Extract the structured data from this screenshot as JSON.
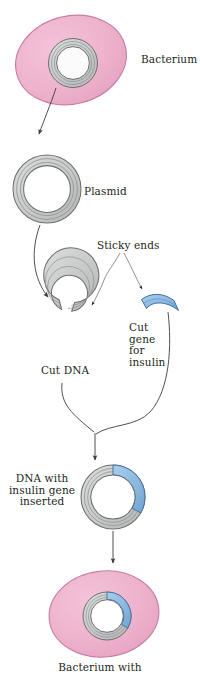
{
  "figure": {
    "background_color": "#ffffff"
  },
  "labels": {
    "bacterium": "Bacterium",
    "plasmid": "Plasmid",
    "sticky_ends": "Sticky ends",
    "cut_dna": "Cut DNA",
    "cut_gene_for_insulin": "Cut\ngene\nfor\ninsulin",
    "dna_with_insulin_gene_inserted": "DNA with\ninsulin gene\ninserted",
    "bacterium_with": "Bacterium with"
  },
  "colors": {
    "bacterium_fill": "#eeb3cd",
    "bacterium_stroke": "#c77ba4",
    "dna_fill": "#c9cbcb",
    "dna_stroke": "#6d6e70",
    "dna_inner_line": "#8c8e90",
    "gene_fill": "#8cb9e0",
    "gene_stroke": "#3f6fa5",
    "cytoplasm_gap": "#ffffff",
    "arrow": "#3b3b3b",
    "text": "#231f20"
  },
  "stages": [
    {
      "id": "stage-1-bacterium",
      "name": "Bacterium",
      "label": "Bacterium",
      "description": "Pink oval bacterium cell containing a circular plasmid"
    },
    {
      "id": "stage-2-plasmid",
      "name": "Plasmid",
      "label": "Plasmid",
      "description": "Closed circular double-stranded DNA ring isolated from the bacterium"
    },
    {
      "id": "stage-3-cut-dna",
      "name": "Cut DNA",
      "label": "Cut DNA",
      "description": "Plasmid opened by restriction enzyme, leaving sticky ends"
    },
    {
      "id": "stage-4-cut-gene",
      "name": "Cut gene for insulin",
      "label": "Cut\ngene\nfor\ninsulin",
      "description": "Blue arc representing the excised human insulin gene with sticky ends"
    },
    {
      "id": "stage-5-recombinant",
      "name": "DNA with insulin gene inserted",
      "label": "DNA with\ninsulin gene\ninserted",
      "description": "Recombinant plasmid, gray ring with blue insulin gene segment spliced in"
    },
    {
      "id": "stage-6-transformed-bacterium",
      "name": "Bacterium with",
      "label": "Bacterium with",
      "description": "Pink oval bacterium now containing the recombinant plasmid"
    }
  ],
  "annotations": [
    {
      "id": "sticky-ends-left",
      "text": "Sticky ends",
      "points_to": "cut-dna-gap"
    },
    {
      "id": "sticky-ends-right",
      "text": "Sticky ends",
      "points_to": "cut-gene-end"
    }
  ]
}
